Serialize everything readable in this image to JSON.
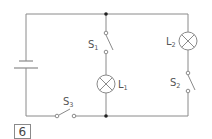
{
  "diagram": {
    "type": "circuit",
    "figure_number": "6",
    "components": [
      {
        "id": "battery",
        "kind": "cell"
      },
      {
        "id": "S1",
        "kind": "switch",
        "label": "S",
        "subscript": "1",
        "state": "open"
      },
      {
        "id": "S2",
        "kind": "switch",
        "label": "S",
        "subscript": "2",
        "state": "open"
      },
      {
        "id": "S3",
        "kind": "switch",
        "label": "S",
        "subscript": "3",
        "state": "open"
      },
      {
        "id": "L1",
        "kind": "lamp",
        "label": "L",
        "subscript": "1"
      },
      {
        "id": "L2",
        "kind": "lamp",
        "label": "L",
        "subscript": "2"
      }
    ],
    "colors": {
      "wire": "#8a8a8a",
      "junction": "#222222",
      "text": "#555555"
    }
  }
}
